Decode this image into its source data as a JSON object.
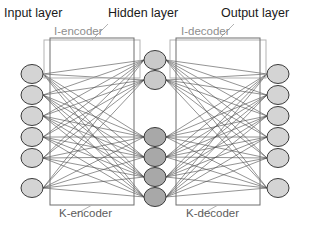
{
  "titles": {
    "input": "Input layer",
    "hidden": "Hidden layer",
    "output": "Output layer"
  },
  "blocks": {
    "i_encoder": "I-encoder",
    "i_decoder": "I-decoder",
    "k_encoder": "K-encoder",
    "k_decoder": "K-decoder"
  },
  "colors": {
    "node_light": "#d4d4d4",
    "node_mid": "#c9c9c9",
    "node_dark": "#a8a8a8",
    "node_stroke": "#3b3b3b",
    "edge": "#4a4a4a",
    "frame_outer": "#b3b3b3",
    "frame_inner": "#6e6e6e",
    "title_text": "#1a1a1a",
    "label_text": "#8e8e8e",
    "background": "#ffffff"
  },
  "diagram": {
    "type": "neural-network",
    "layers": [
      {
        "name": "input",
        "node_count": 6,
        "x": 32,
        "rx": 11,
        "ry": 9.5,
        "fill": "#d4d4d4",
        "nodes_y": [
          74,
          95,
          116,
          137,
          158,
          188
        ]
      },
      {
        "name": "hidden",
        "node_count": 6,
        "x": 155,
        "rx": 11,
        "ry": 9.5,
        "nodes_y": [
          60,
          80,
          137,
          157,
          177,
          197
        ],
        "groups": [
          {
            "name": "hidden-top",
            "indices": [
              0,
              1
            ],
            "fill": "#c9c9c9"
          },
          {
            "name": "hidden-bottom",
            "indices": [
              2,
              3,
              4,
              5
            ],
            "fill": "#a8a8a8"
          }
        ]
      },
      {
        "name": "output",
        "node_count": 6,
        "x": 278,
        "rx": 11,
        "ry": 9.5,
        "fill": "#d4d4d4",
        "nodes_y": [
          74,
          95,
          116,
          137,
          158,
          188
        ]
      }
    ],
    "frames": [
      {
        "name": "i-encoder-frame",
        "x": 44,
        "y": 40,
        "w": 96,
        "h": 38,
        "stroke": "#b3b3b3"
      },
      {
        "name": "k-encoder-frame",
        "x": 50,
        "y": 38,
        "w": 84,
        "h": 167,
        "stroke": "#6e6e6e"
      },
      {
        "name": "i-decoder-frame",
        "x": 170,
        "y": 40,
        "w": 96,
        "h": 38,
        "stroke": "#b3b3b3"
      },
      {
        "name": "k-decoder-frame",
        "x": 176,
        "y": 38,
        "w": 84,
        "h": 167,
        "stroke": "#6e6e6e"
      }
    ],
    "leaders": [
      {
        "name": "i-encoder-leader",
        "from_x": 92,
        "from_y": 40,
        "to_x": 108,
        "to_y": 24
      },
      {
        "name": "i-decoder-leader",
        "from_x": 218,
        "from_y": 40,
        "to_x": 234,
        "to_y": 24
      },
      {
        "name": "k-encoder-leader",
        "from_x": 92,
        "from_y": 205,
        "to_x": 76,
        "to_y": 214
      },
      {
        "name": "k-decoder-leader",
        "from_x": 218,
        "from_y": 205,
        "to_x": 202,
        "to_y": 214
      }
    ]
  }
}
